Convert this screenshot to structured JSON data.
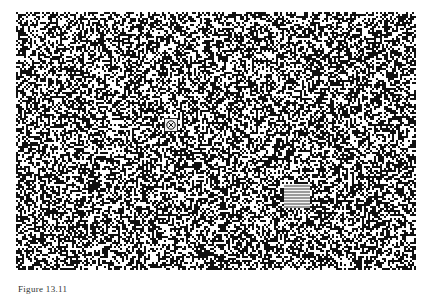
{
  "figure": {
    "caption": "Figure 13.11",
    "noise": {
      "seed": 1311,
      "density": 0.48,
      "cell": 2,
      "fg": "#ffffff",
      "bg": "#111111"
    },
    "marker": {
      "icon": "circled-x-icon",
      "left": 148,
      "top": 106
    },
    "patch": {
      "left": 268,
      "top": 172,
      "width": 26,
      "height": 24
    }
  }
}
